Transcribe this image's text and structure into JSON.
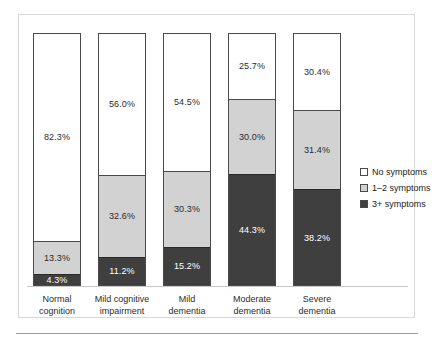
{
  "figure": {
    "caption_rule_visible": true
  },
  "legend": {
    "position": "right",
    "items": [
      {
        "label": "No symptoms",
        "swatch": "white-square-icon",
        "color": "#ffffff"
      },
      {
        "label": "1–2 symptoms",
        "swatch": "lightgray-square-icon",
        "color": "#d2d2d2"
      },
      {
        "label": "3+ symptoms",
        "swatch": "darkgray-square-icon",
        "color": "#3f3f3f"
      }
    ]
  },
  "chart_data": {
    "type": "bar",
    "subtype": "stacked-bar-100-percent",
    "title": "",
    "subtitle": "",
    "xlabel": "",
    "ylabel": "",
    "ylim": [
      0,
      100
    ],
    "grid": false,
    "legend_position": "right",
    "orientation": "vertical",
    "value_suffix": "%",
    "categories": [
      "Normal cognition",
      "Mild cognitive impairment",
      "Mild dementia",
      "Moderate dementia",
      "Severe dementia"
    ],
    "category_lines": [
      [
        "Normal",
        "cognition"
      ],
      [
        "Mild cognitive",
        "impairment"
      ],
      [
        "Mild",
        "dementia"
      ],
      [
        "Moderate",
        "dementia"
      ],
      [
        "Severe",
        "dementia"
      ]
    ],
    "series": [
      {
        "name": "No symptoms",
        "color": "#ffffff",
        "values": [
          82.3,
          56.0,
          54.5,
          25.7,
          30.4
        ],
        "labels": [
          "82.3%",
          "56.0%",
          "54.5%",
          "25.7%",
          "30.4%"
        ]
      },
      {
        "name": "1–2 symptoms",
        "color": "#d2d2d2",
        "values": [
          13.3,
          32.6,
          30.3,
          30.0,
          31.4
        ],
        "labels": [
          "13.3%",
          "32.6%",
          "30.3%",
          "30.0%",
          "31.4%"
        ]
      },
      {
        "name": "3+ symptoms",
        "color": "#3f3f3f",
        "values": [
          4.3,
          11.2,
          15.2,
          44.3,
          38.2
        ],
        "labels": [
          "4.3%",
          "11.2%",
          "15.2%",
          "44.3%",
          "38.2%"
        ]
      }
    ]
  }
}
